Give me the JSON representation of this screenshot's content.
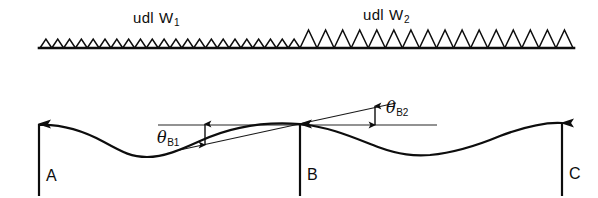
{
  "figure": {
    "background_color": "#ffffff",
    "line_color": "#0d0d0d"
  },
  "load_diagram": {
    "baseline_y": 48,
    "x_start": 40,
    "x_end": 573,
    "regions": [
      {
        "id": "udl-w1",
        "label_text": "udl",
        "symbol": "W",
        "subscript": "1",
        "label_x": 133,
        "label_y": 10,
        "x_start": 40,
        "x_end": 300,
        "triangle_count": 22,
        "triangle_height": 9
      },
      {
        "id": "udl-w2",
        "label_text": "udl",
        "symbol": "W",
        "subscript": "2",
        "label_x": 363,
        "label_y": 7,
        "x_start": 300,
        "x_end": 573,
        "triangle_count": 16,
        "triangle_height": 18
      }
    ]
  },
  "deflection_diagram": {
    "beam_reference_y": 125,
    "curve_points": "M 39,125 C 62,124 82,130 104,142 C 124,153 132,157 147,157 C 164,157 180,150 200,141 C 228,128 262,121 300,124",
    "curve_points_right": "M 300,124 C 330,127 352,137 378,147 C 400,155 414,156 430,155 C 452,153 476,146 500,136 C 524,127 546,122 562,123",
    "tangent_line": {
      "x1": 175,
      "y1": 151,
      "x2": 396,
      "y2": 103
    },
    "horizontal_line": {
      "x1": 158,
      "y1": 125,
      "x2": 437,
      "y2": 125
    },
    "angles": [
      {
        "id": "theta-b1",
        "symbol": "θ",
        "subscript": "B1",
        "label_x": 157,
        "label_y": 130,
        "arrow_x": 205,
        "arrow_top": 124,
        "arrow_bottom": 145
      },
      {
        "id": "theta-b2",
        "symbol": "θ",
        "subscript": "B2",
        "label_x": 386,
        "label_y": 100,
        "arrow_x": 375,
        "arrow_top": 106,
        "arrow_bottom": 125
      }
    ],
    "supports": [
      {
        "id": "support-a",
        "label": "A",
        "x": 39,
        "arrow_top": 124,
        "arrow_bottom": 196,
        "label_x": 46,
        "label_y": 168
      },
      {
        "id": "support-b",
        "label": "B",
        "x": 300,
        "arrow_top": 124,
        "arrow_bottom": 196,
        "label_x": 307,
        "label_y": 167
      },
      {
        "id": "support-c",
        "label": "C",
        "x": 562,
        "arrow_top": 123,
        "arrow_bottom": 196,
        "label_x": 569,
        "label_y": 166
      }
    ]
  }
}
